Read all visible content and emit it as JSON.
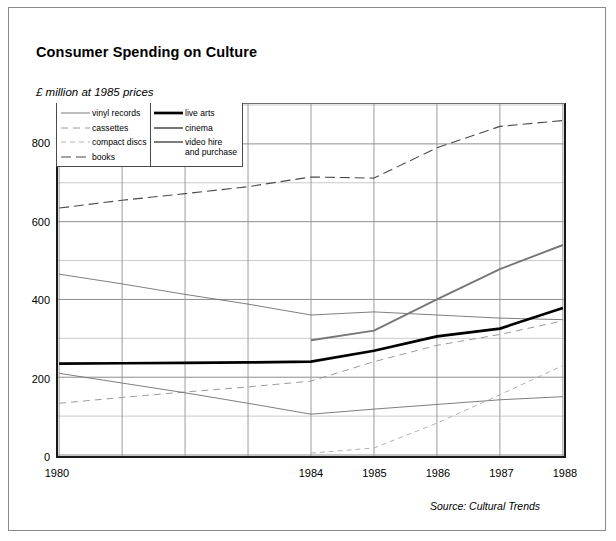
{
  "title": "Consumer Spending on Culture",
  "unit_label": "£ million at 1985 prices",
  "source_note": "Source: Cultural Trends",
  "legend": {
    "left_column": [
      {
        "label": "vinyl records",
        "style": "solid-thin",
        "color": "#6e6e6e"
      },
      {
        "label": "cassettes",
        "style": "dashed",
        "color": "#9a9a9a"
      },
      {
        "label": "compact discs",
        "style": "fine-dash",
        "color": "#b0b0b0"
      },
      {
        "label": "books",
        "style": "long-dash",
        "color": "#4a4a4a"
      }
    ],
    "right_column": [
      {
        "label": "live arts",
        "style": "solid-thick",
        "color": "#000000"
      },
      {
        "label": "cinema",
        "style": "solid-medium",
        "color": "#6e6e6e"
      },
      {
        "label": "video hire\nand purchase",
        "style": "solid-medium",
        "color": "#777777"
      }
    ]
  },
  "chart_data": {
    "type": "line",
    "title": "Consumer Spending on Culture",
    "subtitle": "£ million at 1985 prices",
    "xlabel": "",
    "ylabel": "£ million at 1985 prices",
    "source": "Source: Cultural Trends",
    "grid": true,
    "legend_position": "inside-top-left",
    "x": [
      1980,
      1981,
      1982,
      1983,
      1984,
      1985,
      1986,
      1987,
      1988
    ],
    "xtick_labels": [
      "1980",
      "",
      "",
      "",
      "1984",
      "1985",
      "1986",
      "1987",
      "1988"
    ],
    "xlim": [
      1980,
      1988
    ],
    "ylim": [
      0,
      900
    ],
    "ytick_labels": [
      "0",
      "200",
      "400",
      "600",
      "800"
    ],
    "yticks": [
      0,
      200,
      400,
      600,
      800
    ],
    "minor_gridline_step": 100,
    "series": [
      {
        "name": "books",
        "style": "long-dash",
        "color": "#4a4a4a",
        "values": [
          635,
          655,
          672,
          690,
          715,
          712,
          790,
          845,
          860
        ]
      },
      {
        "name": "vinyl records",
        "style": "solid-thin",
        "color": "#6e6e6e",
        "values": [
          465,
          440,
          413,
          388,
          360,
          368,
          360,
          352,
          348
        ]
      },
      {
        "name": "video hire and purchase",
        "style": "solid-medium",
        "color": "#777777",
        "values": [
          null,
          null,
          null,
          null,
          295,
          320,
          400,
          478,
          540
        ]
      },
      {
        "name": "live arts",
        "style": "solid-thick",
        "color": "#000000",
        "values": [
          235,
          236,
          237,
          238,
          240,
          268,
          305,
          325,
          378
        ]
      },
      {
        "name": "cassettes",
        "style": "dashed",
        "color": "#9a9a9a",
        "values": [
          133,
          148,
          162,
          175,
          190,
          240,
          282,
          310,
          345
        ]
      },
      {
        "name": "cinema",
        "style": "solid-thin",
        "color": "#6e6e6e",
        "values": [
          210,
          185,
          160,
          133,
          105,
          118,
          130,
          142,
          150
        ]
      },
      {
        "name": "compact discs",
        "style": "fine-dash",
        "color": "#b0b0b0",
        "values": [
          null,
          null,
          null,
          null,
          5,
          18,
          82,
          155,
          230
        ]
      }
    ]
  }
}
